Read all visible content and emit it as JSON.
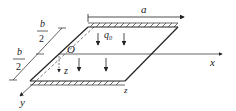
{
  "diagram": {
    "labels": {
      "a": "a",
      "b_num_top": "b",
      "b_den_top": "2",
      "b_num_bottom": "b",
      "b_den_bottom": "2",
      "q0": "q₀",
      "origin": "O",
      "x_axis": "x",
      "y_axis": "y",
      "z_axis": "z",
      "z_edge": "z"
    },
    "colors": {
      "stroke": "#222222",
      "hatch": "#444444"
    }
  }
}
